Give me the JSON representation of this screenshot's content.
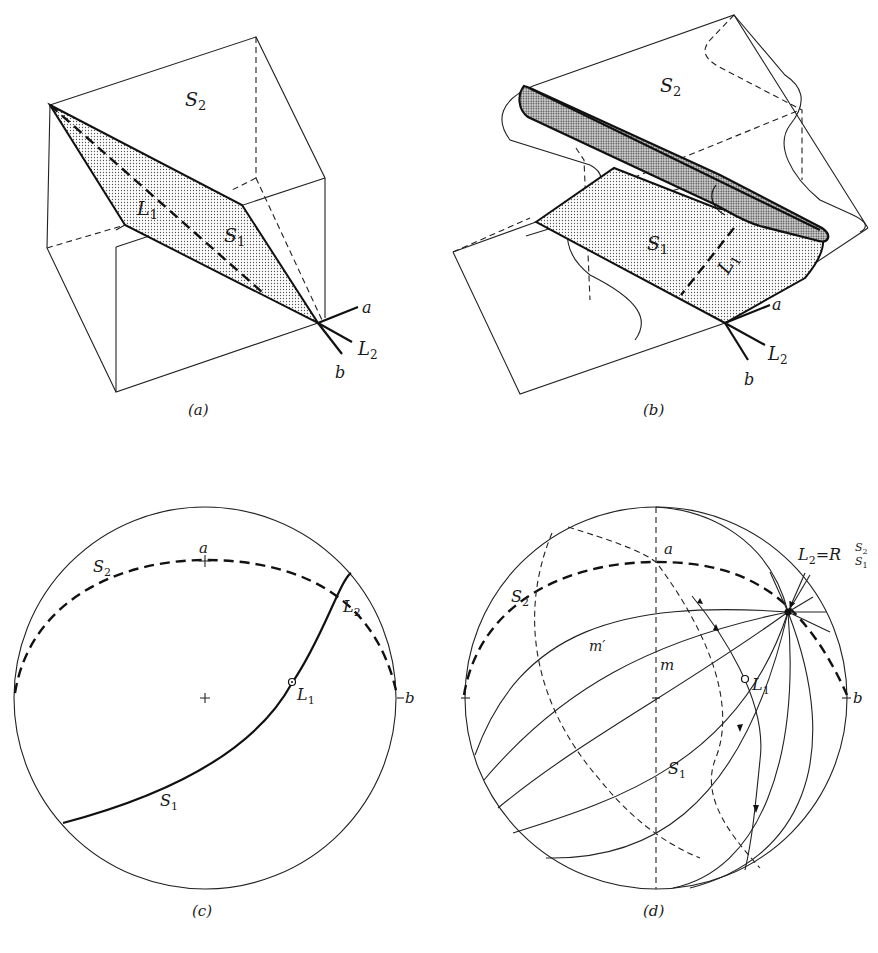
{
  "figure": {
    "panels": [
      {
        "id": "a",
        "caption": "(a)",
        "labels": {
          "s2": "S",
          "s2_sub": "2",
          "l1": "L",
          "l1_sub": "1",
          "s1": "S",
          "s1_sub": "1",
          "a": "a",
          "l2": "L",
          "l2_sub": "2",
          "b": "b"
        }
      },
      {
        "id": "b",
        "caption": "(b)",
        "labels": {
          "s2": "S",
          "s2_sub": "2",
          "s1": "S",
          "s1_sub": "1",
          "l1": "L",
          "l1_sub": "1",
          "a": "a",
          "l2": "L",
          "l2_sub": "2",
          "b": "b"
        }
      },
      {
        "id": "c",
        "caption": "(c)",
        "labels": {
          "a": "a",
          "s2": "S",
          "s2_sub": "2",
          "l2": "L",
          "l2_sub": "2",
          "l1": "L",
          "l1_sub": "1",
          "b": "b",
          "s1": "S",
          "s1_sub": "1"
        }
      },
      {
        "id": "d",
        "caption": "(d)",
        "labels": {
          "a": "a",
          "s2": "S",
          "s2_sub": "2",
          "l2_eq": "L",
          "l2_eq_sub": "2",
          "eq": "=R",
          "r_sup": "S",
          "r_sup_sub": "2",
          "r_sub": "S",
          "r_sub_sub": "1",
          "m_prime": "m′",
          "m": "m",
          "l1": "L",
          "l1_sub": "1",
          "b": "b",
          "s1": "S",
          "s1_sub": "1"
        }
      }
    ]
  },
  "colors": {
    "ink": "#111111",
    "paper": "#ffffff",
    "stipple": "#9a9a9a"
  }
}
